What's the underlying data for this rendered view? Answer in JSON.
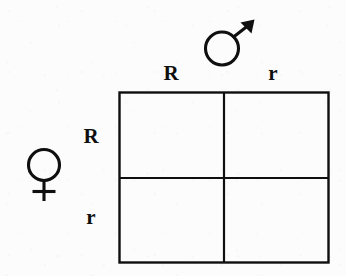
{
  "diagram": {
    "type": "punnett-square",
    "line_color": "#100f0f",
    "background_color": "#fcfcfc",
    "grid": {
      "rows": 2,
      "columns": 2,
      "cells": [
        {
          "row": 0,
          "column": 0,
          "text": ""
        },
        {
          "row": 0,
          "column": 1,
          "text": ""
        },
        {
          "row": 1,
          "column": 0,
          "text": ""
        },
        {
          "row": 1,
          "column": 1,
          "text": ""
        }
      ]
    },
    "parents": {
      "male": {
        "icon": "mars-symbol-icon",
        "glyph": "♂",
        "position": "top",
        "alleles": [
          "R",
          "r"
        ]
      },
      "female": {
        "icon": "venus-symbol-icon",
        "glyph": "♀",
        "position": "left",
        "alleles": [
          "R",
          "r"
        ]
      }
    },
    "column_headers": [
      "R",
      "r"
    ],
    "row_headers": [
      "R",
      "r"
    ]
  }
}
